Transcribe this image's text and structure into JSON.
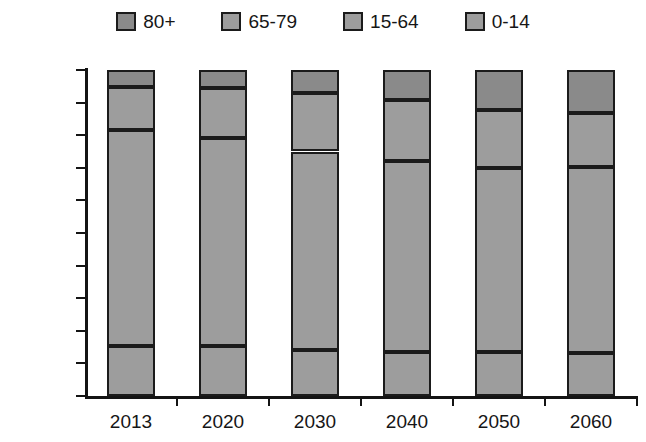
{
  "chart_data": {
    "type": "bar",
    "stacked": true,
    "stack_normalized_percent": true,
    "title": "",
    "subtitle": "",
    "xlabel": "",
    "ylabel": "",
    "categories": [
      "2013",
      "2020",
      "2030",
      "2040",
      "2050",
      "2060"
    ],
    "ylim": [
      0,
      100
    ],
    "ytick_labels": [
      "0%",
      "10%",
      "20%",
      "30%",
      "40%",
      "50%",
      "60%",
      "70%",
      "80%",
      "90%",
      "100%"
    ],
    "ytick_values": [
      0,
      10,
      20,
      30,
      40,
      50,
      60,
      70,
      80,
      90,
      100
    ],
    "grid": false,
    "legend_position": "top",
    "series": [
      {
        "name": "0-14",
        "color": "#9d9d9d",
        "values": [
          15.3,
          15.2,
          14.0,
          13.6,
          13.6,
          13.2
        ]
      },
      {
        "name": "15-64",
        "color": "#9d9d9d",
        "values": [
          66.2,
          63.8,
          61.0,
          58.4,
          56.4,
          57.0
        ]
      },
      {
        "name": "65-79",
        "color": "#9d9d9d",
        "values": [
          13.4,
          15.6,
          18.0,
          18.9,
          17.6,
          16.6
        ]
      },
      {
        "name": "80+",
        "color": "#8a8a8a",
        "values": [
          5.1,
          5.4,
          7.0,
          9.1,
          12.4,
          13.2
        ]
      }
    ],
    "cumulative_tops": {
      "0-14": [
        15.3,
        15.2,
        14.0,
        13.6,
        13.6,
        13.2
      ],
      "15-64": [
        81.5,
        79.0,
        75.0,
        72.0,
        70.0,
        70.2
      ],
      "65-79": [
        94.9,
        94.6,
        93.0,
        90.9,
        87.6,
        86.8
      ],
      "80+": [
        100,
        100,
        100,
        100,
        100,
        100
      ]
    }
  },
  "legend": {
    "items": [
      {
        "label": "80+",
        "color": "#8a8a8a"
      },
      {
        "label": "65-79",
        "color": "#9d9d9d"
      },
      {
        "label": "15-64",
        "color": "#9d9d9d"
      },
      {
        "label": "0-14",
        "color": "#9d9d9d"
      }
    ]
  },
  "colors": {
    "axis": "#141414",
    "border": "#1b1b1b",
    "dark_gray": "#8a8a8a",
    "light_gray": "#9d9d9d",
    "background": "#ffffff"
  }
}
